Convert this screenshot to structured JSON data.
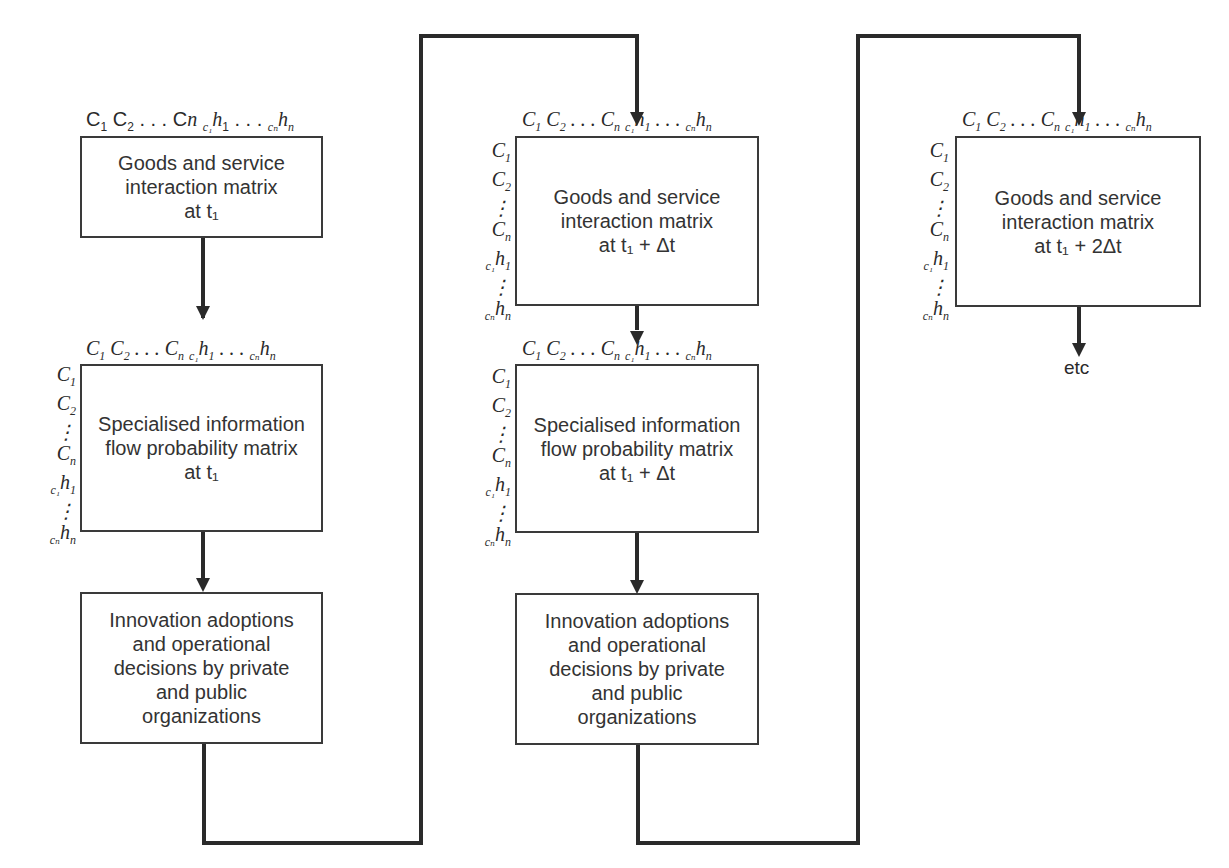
{
  "diagram": {
    "column_header": "C₁ C₂ . . . Cₙ c₁h₁ . . . cₙhₙ",
    "row_header": [
      "C₁",
      "C₂",
      ":",
      "Cₙ",
      "c₁h₁",
      ":",
      "cₙhₙ"
    ],
    "columns": [
      {
        "id": "t1",
        "boxes": [
          {
            "lines": [
              "Goods and service",
              "interaction matrix",
              "at t₁"
            ]
          },
          {
            "lines": [
              "Specialised information",
              "flow probability matrix",
              "at t₁"
            ]
          },
          {
            "lines": [
              "Innovation adoptions",
              "and operational",
              "decisions by private",
              "and public",
              "organizations"
            ]
          }
        ]
      },
      {
        "id": "t1_plus_dt",
        "boxes": [
          {
            "lines": [
              "Goods and service",
              "interaction matrix",
              "at t₁ + Δt"
            ]
          },
          {
            "lines": [
              "Specialised information",
              "flow probability matrix",
              "at t₁ + Δt"
            ]
          },
          {
            "lines": [
              "Innovation adoptions",
              "and operational",
              "decisions by private",
              "and public",
              "organizations"
            ]
          }
        ]
      },
      {
        "id": "t1_plus_2dt",
        "boxes": [
          {
            "lines": [
              "Goods and service",
              "interaction matrix",
              "at t₁ + 2Δt"
            ]
          }
        ]
      }
    ],
    "end_label": "etc",
    "line_color": "#2a2a2a"
  }
}
